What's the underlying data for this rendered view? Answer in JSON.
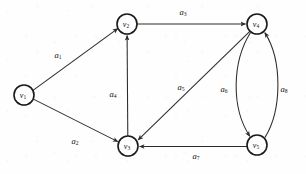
{
  "figure": {
    "type": "directed-graph-diagram",
    "background_color": "#fefefe",
    "stroke_color": "#2b2b2b",
    "width": 306,
    "height": 174
  },
  "nodes": [
    {
      "id": "v1",
      "label": "v",
      "sub": "1",
      "cx": 24,
      "cy": 95,
      "r": 10
    },
    {
      "id": "v2",
      "label": "v",
      "sub": "2",
      "cx": 127,
      "cy": 24,
      "r": 10
    },
    {
      "id": "v3",
      "label": "v",
      "sub": "3",
      "cx": 128,
      "cy": 146,
      "r": 10
    },
    {
      "id": "v4",
      "label": "v",
      "sub": "4",
      "cx": 257,
      "cy": 24,
      "r": 10
    },
    {
      "id": "v5",
      "label": "v",
      "sub": "5",
      "cx": 257,
      "cy": 145,
      "r": 10
    }
  ],
  "edges": [
    {
      "id": "a1",
      "label": "a",
      "sub": "1",
      "from": "v1",
      "to": "v2",
      "shape": "straight",
      "label_x": 58,
      "label_y": 56
    },
    {
      "id": "a2",
      "label": "a",
      "sub": "2",
      "from": "v1",
      "to": "v3",
      "shape": "straight",
      "label_x": 75,
      "label_y": 142
    },
    {
      "id": "a3",
      "label": "a",
      "sub": "3",
      "from": "v2",
      "to": "v4",
      "shape": "straight",
      "label_x": 183,
      "label_y": 13
    },
    {
      "id": "a4",
      "label": "a",
      "sub": "4",
      "from": "v3",
      "to": "v2",
      "shape": "straight",
      "label_x": 113,
      "label_y": 95
    },
    {
      "id": "a5",
      "label": "a",
      "sub": "5",
      "from": "v4",
      "to": "v3",
      "shape": "straight",
      "label_x": 181,
      "label_y": 88
    },
    {
      "id": "a6",
      "label": "a",
      "sub": "6",
      "from": "v4",
      "to": "v5",
      "shape": "curve-left",
      "label_x": 224,
      "label_y": 90
    },
    {
      "id": "a7",
      "label": "a",
      "sub": "7",
      "from": "v5",
      "to": "v3",
      "shape": "straight",
      "label_x": 196,
      "label_y": 157
    },
    {
      "id": "a8",
      "label": "a",
      "sub": "8",
      "from": "v5",
      "to": "v4",
      "shape": "curve-right",
      "label_x": 284,
      "label_y": 90
    }
  ]
}
